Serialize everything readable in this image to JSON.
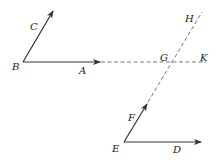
{
  "diagram": {
    "labels": {
      "A": "A",
      "B": "B",
      "C": "C",
      "D": "D",
      "E": "E",
      "F": "F",
      "G": "G",
      "H": "H",
      "K": "K"
    },
    "colors": {
      "line": "#333333",
      "dashed": "#555555",
      "text": "#222222",
      "background": "#ffffff"
    }
  }
}
